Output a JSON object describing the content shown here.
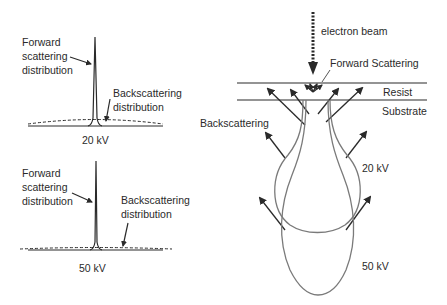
{
  "left_panels": [
    {
      "voltage_label": "20 kV",
      "forward_label": [
        "Forward",
        "scattering",
        "distribution"
      ],
      "back_label": [
        "Backscattering",
        "distribution"
      ]
    },
    {
      "voltage_label": "50 kV",
      "forward_label": [
        "Forward",
        "scattering",
        "distribution"
      ],
      "back_label": [
        "Backscattering",
        "distribution"
      ]
    }
  ],
  "right_panel": {
    "beam_label": "electron beam",
    "forward_scattering_label": "Forward Scattering",
    "resist_label": "Resist",
    "substrate_label": "Substrate",
    "backscattering_label": "Backscattering",
    "volume_labels": [
      "20 kV",
      "50 kV"
    ]
  },
  "colors": {
    "ink": "#2a2a2a",
    "curve": "#7a7a7a",
    "background": "#ffffff"
  }
}
